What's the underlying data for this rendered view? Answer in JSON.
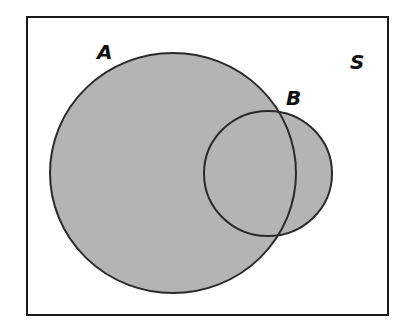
{
  "diagram": {
    "type": "venn",
    "universe": {
      "label": "S",
      "x": 27,
      "y": 17,
      "width": 361,
      "height": 298,
      "stroke": "#1a1a1a",
      "fill": "#ffffff"
    },
    "sets": [
      {
        "label": "A",
        "cx": 173,
        "cy": 173,
        "rx": 123,
        "ry": 120,
        "fill": "#b4b4b4",
        "stroke": "#2a2a2a",
        "label_x": 97,
        "label_y": 59
      },
      {
        "label": "B",
        "cx": 268,
        "cy": 173.5,
        "rx": 64,
        "ry": 62.5,
        "fill": "#b4b4b4",
        "stroke": "#2a2a2a",
        "label_x": 286,
        "label_y": 105
      }
    ],
    "shaded_region": "A ∪ B",
    "universe_label_x": 350,
    "universe_label_y": 69
  }
}
